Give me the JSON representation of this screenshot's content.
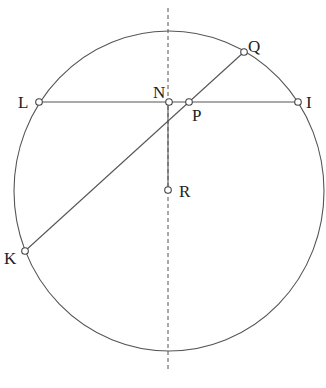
{
  "diagram": {
    "type": "geometry-circle",
    "circle": {
      "cx": 169,
      "cy": 191,
      "rx": 155,
      "ry": 160,
      "color": "#555555"
    },
    "axis": {
      "x": 168,
      "y1": 8,
      "y2": 372,
      "style": "dashed"
    },
    "points": {
      "L": {
        "label": "L",
        "x": 39,
        "y": 102
      },
      "N": {
        "label": "N",
        "x": 169,
        "y": 102
      },
      "P": {
        "label": "P",
        "x": 189,
        "y": 102
      },
      "I": {
        "label": "I",
        "x": 298,
        "y": 102
      },
      "Q": {
        "label": "Q",
        "x": 244,
        "y": 52
      },
      "K": {
        "label": "K",
        "x": 25,
        "y": 251
      },
      "R": {
        "label": "R",
        "x": 168,
        "y": 190
      }
    },
    "segments": [
      {
        "from": "L",
        "to": "I"
      },
      {
        "from": "K",
        "to": "Q"
      },
      {
        "from": "N",
        "to": "R"
      }
    ]
  }
}
